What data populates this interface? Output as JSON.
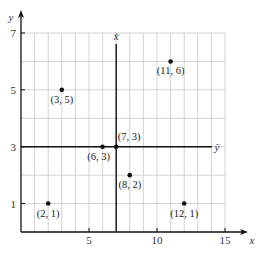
{
  "chart_data": {
    "type": "scatter",
    "title": "",
    "xlabel": "x",
    "ylabel": "y",
    "xlim": [
      0,
      15
    ],
    "ylim": [
      0,
      7
    ],
    "grid": true,
    "x_ticks": [
      5,
      10,
      15
    ],
    "y_ticks": [
      1,
      3,
      5,
      7
    ],
    "points": [
      {
        "x": 2,
        "y": 1,
        "label": "(2, 1)"
      },
      {
        "x": 3,
        "y": 5,
        "label": "(3, 5)"
      },
      {
        "x": 6,
        "y": 3,
        "label": "(6, 3)"
      },
      {
        "x": 7,
        "y": 3,
        "label": "(7, 3)"
      },
      {
        "x": 8,
        "y": 2,
        "label": "(8, 2)"
      },
      {
        "x": 11,
        "y": 6,
        "label": "(11, 6)"
      },
      {
        "x": 12,
        "y": 1,
        "label": "(12, 1)"
      }
    ],
    "reference_lines": [
      {
        "orientation": "vertical",
        "value": 7,
        "label": "x̄"
      },
      {
        "orientation": "horizontal",
        "value": 3,
        "label": "ȳ"
      }
    ]
  },
  "colors": {
    "grid": "#c8c8c8",
    "axis": "#111111",
    "point": "#111111"
  }
}
